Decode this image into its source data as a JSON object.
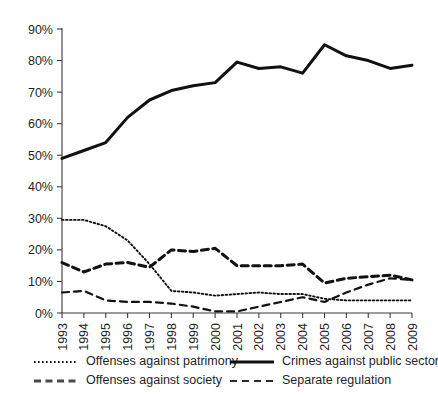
{
  "chart_data": {
    "type": "line",
    "title": "",
    "xlabel": "",
    "ylabel": "",
    "x": [
      1993,
      1994,
      1995,
      1996,
      1997,
      1998,
      1999,
      2000,
      2001,
      2002,
      2003,
      2004,
      2005,
      2006,
      2007,
      2008,
      2009
    ],
    "xtick_labels": [
      "1993",
      "1994",
      "1995",
      "1996",
      "1997",
      "1998",
      "1999",
      "2000",
      "2001",
      "2002",
      "2003",
      "2004",
      "2005",
      "2006",
      "2007",
      "2008",
      "2009"
    ],
    "ytick_labels": [
      "0%",
      "10%",
      "20%",
      "30%",
      "40%",
      "50%",
      "60%",
      "70%",
      "80%",
      "90%"
    ],
    "ytick_values": [
      0,
      10,
      20,
      30,
      40,
      50,
      60,
      70,
      80,
      90
    ],
    "ylim": [
      0,
      90
    ],
    "xlim": [
      1993,
      2009
    ],
    "grid": false,
    "legend_position": "bottom",
    "series": [
      {
        "name": "Offenses against patrimony",
        "style": "dotted",
        "color": "#111111",
        "values": [
          29.5,
          29.5,
          27.5,
          23.0,
          15.5,
          7.0,
          6.5,
          5.5,
          6.0,
          6.5,
          6.0,
          6.0,
          4.5,
          4.0,
          4.0,
          4.0,
          4.0
        ]
      },
      {
        "name": "Crimes against public sector",
        "style": "solid",
        "color": "#111111",
        "values": [
          49.0,
          51.5,
          54.0,
          62.0,
          67.5,
          70.5,
          72.0,
          73.0,
          79.5,
          77.5,
          78.0,
          76.0,
          85.0,
          81.5,
          80.0,
          77.5,
          78.5
        ]
      },
      {
        "name": "Offenses against society",
        "style": "dashed-thick",
        "color": "#4a4a4a",
        "values": [
          16.0,
          13.0,
          15.5,
          16.0,
          14.5,
          20.0,
          19.5,
          20.5,
          15.0,
          15.0,
          15.0,
          15.5,
          9.5,
          11.0,
          11.5,
          12.0,
          10.5
        ]
      },
      {
        "name": "Separate regulation",
        "style": "dashed",
        "color": "#2b2b2b",
        "values": [
          6.5,
          7.0,
          4.0,
          3.5,
          3.5,
          3.0,
          2.0,
          0.5,
          0.5,
          2.0,
          3.5,
          5.0,
          3.5,
          6.5,
          9.0,
          11.0,
          10.5
        ]
      }
    ],
    "legend": [
      {
        "label": "Offenses against patrimony",
        "style": "dotted"
      },
      {
        "label": "Crimes against public sector",
        "style": "solid"
      },
      {
        "label": "Offenses against society",
        "style": "dashed-thick"
      },
      {
        "label": "Separate regulation",
        "style": "dashed"
      }
    ]
  }
}
